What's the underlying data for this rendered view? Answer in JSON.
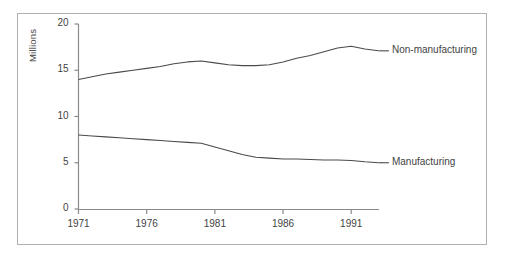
{
  "chart_data": {
    "type": "line",
    "title": "",
    "subtitle": "",
    "xlabel": "",
    "ylabel": "Millions",
    "xlim": [
      1971,
      1993
    ],
    "ylim": [
      0,
      20
    ],
    "grid": false,
    "legend_position": "inline-right-of-series-end",
    "xticks": [
      1971,
      1976,
      1981,
      1986,
      1991
    ],
    "xtick_labels": [
      "1971",
      "1976",
      "1981",
      "1986",
      "1991"
    ],
    "yticks": [
      0,
      5,
      10,
      15,
      20
    ],
    "ytick_labels": [
      "0",
      "5",
      "10",
      "15",
      "20"
    ],
    "x": [
      1971,
      1972,
      1973,
      1974,
      1975,
      1976,
      1977,
      1978,
      1979,
      1980,
      1981,
      1982,
      1983,
      1984,
      1985,
      1986,
      1987,
      1988,
      1989,
      1990,
      1991,
      1992,
      1993
    ],
    "series": [
      {
        "name": "Non-manufacturing",
        "color": "#4a4a4a",
        "values": [
          14.0,
          14.3,
          14.6,
          14.8,
          15.0,
          15.2,
          15.4,
          15.7,
          15.9,
          16.0,
          15.8,
          15.6,
          15.5,
          15.5,
          15.6,
          15.9,
          16.3,
          16.6,
          17.0,
          17.4,
          17.6,
          17.3,
          17.1
        ]
      },
      {
        "name": "Manufacturing",
        "color": "#4a4a4a",
        "values": [
          8.0,
          7.9,
          7.8,
          7.7,
          7.6,
          7.5,
          7.4,
          7.3,
          7.2,
          7.1,
          6.7,
          6.3,
          5.9,
          5.6,
          5.5,
          5.4,
          5.4,
          5.35,
          5.3,
          5.3,
          5.25,
          5.1,
          5.0
        ]
      }
    ],
    "annotations": [
      {
        "text": "Non-manufacturing",
        "x": 1993.4,
        "y": 17.1
      },
      {
        "text": "Manufacturing",
        "x": 1993.4,
        "y": 5.0
      }
    ]
  }
}
